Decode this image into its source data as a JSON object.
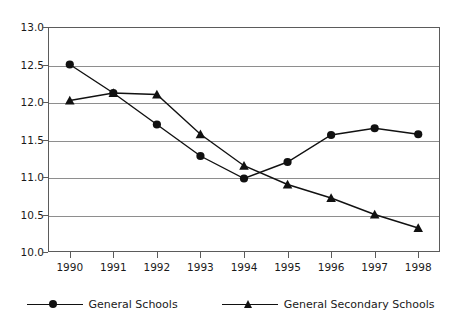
{
  "chart_data": {
    "type": "line",
    "title": "",
    "xlabel": "",
    "ylabel": "",
    "categories": [
      "1990",
      "1991",
      "1992",
      "1993",
      "1994",
      "1995",
      "1996",
      "1997",
      "1998"
    ],
    "ylim": [
      10.0,
      13.0
    ],
    "ytick_labels": [
      "13.0",
      "12.5",
      "12.0",
      "11.5",
      "11.0",
      "10.5",
      "10.0"
    ],
    "ytick_values": [
      13.0,
      12.5,
      12.0,
      11.5,
      11.0,
      10.5,
      10.0
    ],
    "grid": "horizontal",
    "legend_position": "bottom",
    "series": [
      {
        "name": "General Schools",
        "marker": "circle",
        "values": [
          12.5,
          12.12,
          11.7,
          11.28,
          10.98,
          11.2,
          11.56,
          11.65,
          11.57
        ]
      },
      {
        "name": "General Secondary Schools",
        "marker": "triangle",
        "values": [
          12.02,
          12.12,
          12.1,
          11.57,
          11.15,
          10.9,
          10.72,
          10.5,
          10.32
        ]
      }
    ]
  },
  "legend": {
    "entries": [
      {
        "label": "General Schools"
      },
      {
        "label": "General Secondary Schools"
      }
    ]
  }
}
